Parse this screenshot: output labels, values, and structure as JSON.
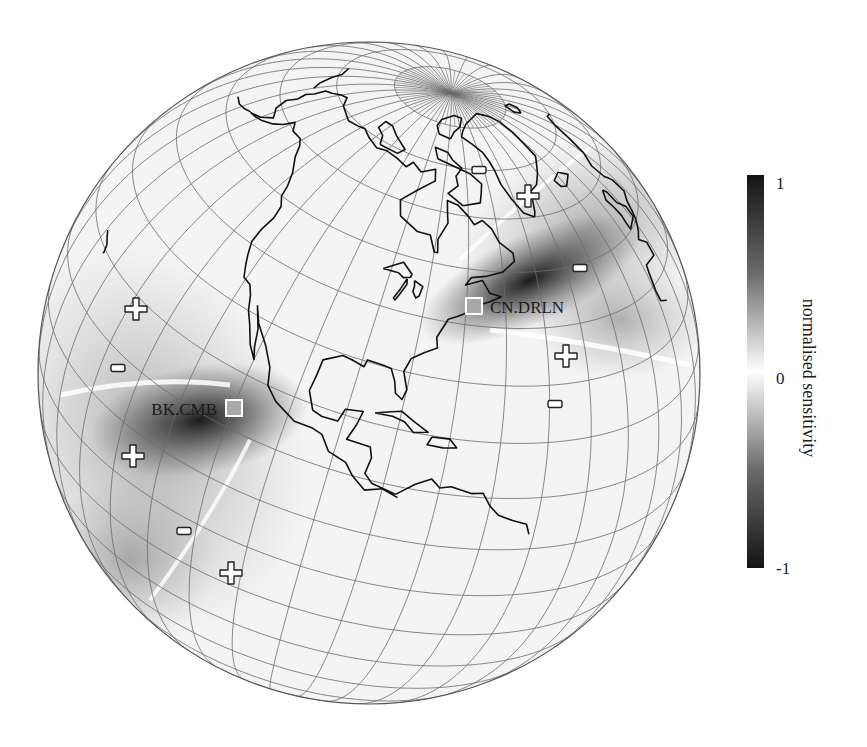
{
  "figure": {
    "projection": "orthographic",
    "view": {
      "center_lat": 28.2,
      "center_lon": -88,
      "roll_deg": -16.4
    },
    "globe": {
      "cx": 369,
      "cy": 373,
      "r": 331
    },
    "graticule": {
      "lat_step": 10,
      "lon_step": 10,
      "pole_lon_step": 5,
      "color": "#6b6b6b"
    },
    "coast_color": "#111111"
  },
  "stations": [
    {
      "id": "CN.DRLN",
      "label": "CN.DRLN",
      "x": 474,
      "y": 306,
      "label_x": 490,
      "label_y": 313,
      "anchor": "start",
      "fill": "#a8a8a8"
    },
    {
      "id": "BK.CMB",
      "label": "BK.CMB",
      "x": 234,
      "y": 408,
      "label_x": 217,
      "label_y": 415,
      "anchor": "end",
      "fill": "#a8a8a8"
    }
  ],
  "sign_markers": [
    {
      "sign": "+",
      "x": 136,
      "y": 309
    },
    {
      "sign": "-",
      "x": 118,
      "y": 368
    },
    {
      "sign": "+",
      "x": 133,
      "y": 456
    },
    {
      "sign": "-",
      "x": 184,
      "y": 531
    },
    {
      "sign": "+",
      "x": 231,
      "y": 573
    },
    {
      "sign": "-",
      "x": 479,
      "y": 170
    },
    {
      "sign": "+",
      "x": 528,
      "y": 196
    },
    {
      "sign": "-",
      "x": 580,
      "y": 268
    },
    {
      "sign": "+",
      "x": 566,
      "y": 356
    },
    {
      "sign": "-",
      "x": 555,
      "y": 404
    }
  ],
  "colorbar": {
    "x": 747,
    "y": 175,
    "width": 17,
    "height": 393,
    "ticks": [
      {
        "label": "1",
        "y": 183
      },
      {
        "label": "0",
        "y": 378
      },
      {
        "label": "-1",
        "y": 568
      }
    ],
    "label": "normalised sensitivity",
    "colors": {
      "top": "#141414",
      "mid": "#ffffff",
      "bottom": "#141414"
    },
    "range": [
      -1,
      1
    ]
  },
  "chart_data": {
    "type": "heatmap",
    "title": "",
    "colorbar_label": "normalised sensitivity",
    "colorbar_ticks": [
      "-1",
      "0",
      "1"
    ],
    "range": [
      -1,
      1
    ],
    "stations": [
      "BK.CMB",
      "CN.DRLN"
    ],
    "sign_annotations": [
      "+",
      "-",
      "+",
      "-",
      "+",
      "-",
      "+",
      "-",
      "+",
      "-"
    ]
  }
}
